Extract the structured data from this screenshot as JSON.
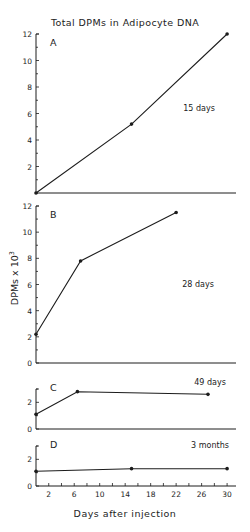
{
  "chart_data": {
    "type": "line",
    "title": "Total DPMs in Adipocyte DNA",
    "xlabel": "Days after injection",
    "ylabel": "DPMs x 10",
    "ylabel_superscript": "3",
    "x_ticks_labeled": [
      2,
      6,
      10,
      14,
      18,
      22,
      26,
      30
    ],
    "xlim": [
      0,
      31
    ],
    "panels": [
      {
        "label": "A",
        "annotation": "15 days",
        "ylim": [
          0,
          12
        ],
        "y_ticks_labeled": [
          2,
          4,
          6,
          8,
          10,
          12
        ],
        "y_minor_step": 1,
        "x": [
          0,
          15,
          30
        ],
        "y": [
          0,
          5.2,
          12
        ]
      },
      {
        "label": "B",
        "annotation": "28 days",
        "ylim": [
          0,
          12
        ],
        "y_ticks_labeled": [
          0,
          2,
          4,
          6,
          8,
          10,
          12
        ],
        "y_minor_step": 1,
        "x": [
          0,
          7,
          22
        ],
        "y": [
          2.2,
          7.8,
          11.5
        ]
      },
      {
        "label": "C",
        "annotation": "49 days",
        "ylim": [
          0,
          3
        ],
        "y_ticks_labeled": [
          0,
          2
        ],
        "y_minor_step": 1,
        "x": [
          0,
          6.5,
          27
        ],
        "y": [
          1.1,
          2.8,
          2.6
        ]
      },
      {
        "label": "D",
        "annotation": "3 months",
        "ylim": [
          0,
          3
        ],
        "y_ticks_labeled": [
          0,
          2
        ],
        "y_minor_step": 1,
        "x": [
          0,
          15,
          30
        ],
        "y": [
          1.1,
          1.3,
          1.3
        ]
      }
    ]
  },
  "layout": {
    "x0_px": 36,
    "px_per_day": 6.37,
    "x_axis_end_px": 236,
    "panels_px": [
      {
        "y_zero": 193,
        "y_top": 34
      },
      {
        "y_zero": 363,
        "y_top": 206
      },
      {
        "y_zero": 429,
        "y_top": 389
      },
      {
        "y_zero": 486,
        "y_top": 446
      }
    ]
  }
}
